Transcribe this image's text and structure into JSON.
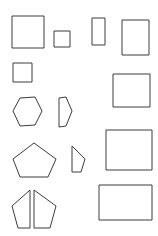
{
  "canvas": {
    "width": 158,
    "height": 236,
    "background_color": "#ffffff",
    "stroke_color": "#3c3c3c",
    "fill_color": "#ffffff",
    "stroke_width": 1,
    "description": "Line drawing sheet of 14 outlined geometric shapes arranged in an irregular grid"
  },
  "shapes": [
    {
      "id": "square-large-top-left",
      "name": "square",
      "kind": "polygon",
      "row": 1,
      "column": 1,
      "points": "12,16 44,16 44,48 12,48",
      "bbox": {
        "x": 12,
        "y": 16,
        "width": 32,
        "height": 32
      }
    },
    {
      "id": "square-small-top-center",
      "name": "square",
      "kind": "polygon",
      "row": 1,
      "column": 2,
      "points": "54,31 70,31 70,47 54,47",
      "bbox": {
        "x": 54,
        "y": 31,
        "width": 16,
        "height": 16
      }
    },
    {
      "id": "rectangle-narrow-top",
      "name": "rectangle",
      "kind": "polygon",
      "row": 1,
      "column": 3,
      "points": "92,18 105,18 105,45 92,45",
      "bbox": {
        "x": 92,
        "y": 18,
        "width": 13,
        "height": 27
      }
    },
    {
      "id": "rectangle-portrait-top-right",
      "name": "rectangle",
      "kind": "polygon",
      "row": 1,
      "column": 4,
      "points": "122,20 149,20 149,55 122,55",
      "bbox": {
        "x": 122,
        "y": 20,
        "width": 27,
        "height": 35
      }
    },
    {
      "id": "square-small-second-row",
      "name": "square",
      "kind": "polygon",
      "row": 2,
      "column": 1,
      "points": "13,63 32,63 32,82 13,82",
      "bbox": {
        "x": 13,
        "y": 63,
        "width": 19,
        "height": 19
      }
    },
    {
      "id": "square-medium-second-row-right",
      "name": "square",
      "kind": "polygon",
      "row": 2,
      "column": 4,
      "points": "113,74 150,74 150,107 113,107",
      "bbox": {
        "x": 113,
        "y": 74,
        "width": 37,
        "height": 33
      }
    },
    {
      "id": "hexagon-left",
      "name": "hexagon",
      "kind": "polygon",
      "row": 3,
      "column": 1,
      "points": "20,98 35,97 42,111 35,125 20,126 13,111",
      "bbox": {
        "x": 13,
        "y": 97,
        "width": 29,
        "height": 29
      }
    },
    {
      "id": "d-shape-partial-hexagon",
      "name": "partial-hexagon",
      "kind": "polygon",
      "row": 3,
      "column": 2,
      "points": "59,98 66,97 72,111 66,126 59,127",
      "bbox": {
        "x": 59,
        "y": 97,
        "width": 13,
        "height": 30
      }
    },
    {
      "id": "rectangle-landscape-third-row",
      "name": "rectangle",
      "kind": "polygon",
      "row": 4,
      "column": 4,
      "points": "106,130 152,130 152,170 106,170",
      "bbox": {
        "x": 106,
        "y": 130,
        "width": 46,
        "height": 40
      }
    },
    {
      "id": "pentagon-left",
      "name": "pentagon",
      "kind": "polygon",
      "row": 4,
      "column": 1,
      "points": "34,143 56,159 48,177 20,177 13,159",
      "bbox": {
        "x": 13,
        "y": 143,
        "width": 43,
        "height": 34
      }
    },
    {
      "id": "trapezoid-partial-pentagon",
      "name": "partial-pentagon",
      "kind": "polygon",
      "row": 4,
      "column": 2,
      "points": "72,146 85,159 81,172 72,172",
      "bbox": {
        "x": 72,
        "y": 146,
        "width": 13,
        "height": 26
      }
    },
    {
      "id": "pentagon-split-left-half",
      "name": "split-pentagon-left",
      "kind": "polygon",
      "row": 5,
      "column": 1,
      "points": "30,190 30,228 18,228 12,206",
      "bbox": {
        "x": 12,
        "y": 190,
        "width": 18,
        "height": 38
      }
    },
    {
      "id": "pentagon-split-right-half",
      "name": "split-pentagon-right",
      "kind": "polygon",
      "row": 5,
      "column": 2,
      "points": "34,190 56,206 50,228 34,228",
      "bbox": {
        "x": 34,
        "y": 190,
        "width": 22,
        "height": 38
      }
    },
    {
      "id": "rectangle-landscape-bottom-right",
      "name": "rectangle",
      "kind": "polygon",
      "row": 5,
      "column": 4,
      "points": "99,185 152,185 152,220 99,220",
      "bbox": {
        "x": 99,
        "y": 185,
        "width": 53,
        "height": 35
      }
    }
  ]
}
